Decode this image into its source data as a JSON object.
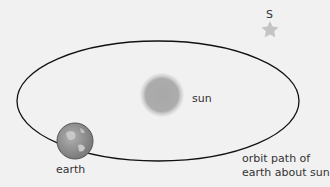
{
  "diagram": {
    "labels": {
      "sun": "sun",
      "earth": "earth",
      "star": "S",
      "orbit_line1": "orbit path of",
      "orbit_line2": "earth about sun"
    },
    "colors": {
      "background": "#f1f1f1",
      "orbit": "#111111",
      "sun": "#a9a9a9",
      "earth": "#8f8f8f",
      "star": "#c4c4c4"
    }
  }
}
